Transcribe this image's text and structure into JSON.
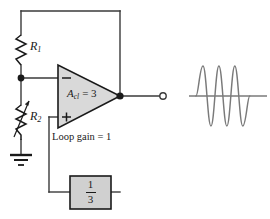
{
  "figure": {
    "type": "schematic",
    "components": {
      "r1": {
        "label": "R",
        "subscript": "1",
        "kind": "fixed-resistor"
      },
      "r2": {
        "label": "R",
        "subscript": "2",
        "kind": "variable-resistor"
      },
      "ground": {
        "kind": "earth-ground"
      },
      "opamp": {
        "gain_label": "A",
        "gain_subscript": "cl",
        "gain_value": "= 3",
        "gain_text": "Acl = 3",
        "inverting_sign": "−",
        "noninverting_sign": "+"
      },
      "feedback_block": {
        "numerator": "1",
        "denominator": "3",
        "text": "1/3"
      },
      "loop_gain": {
        "text": "Loop gain = 1"
      },
      "output_terminal": {
        "kind": "open-circle-terminal"
      }
    },
    "waveform": {
      "name": "output-sine-wave",
      "cycles": 3,
      "shape": "sine"
    },
    "colors": {
      "wire": "#3a3a3a",
      "opamp_fill": "#d9d9d9",
      "opamp_stroke": "#1a1a1a",
      "block_fill": "#d0d0d0",
      "block_stroke": "#1a1a1a",
      "text": "#1a1a1a",
      "waveform": "#7a7a7a",
      "baseline": "#7a7a7a"
    }
  }
}
